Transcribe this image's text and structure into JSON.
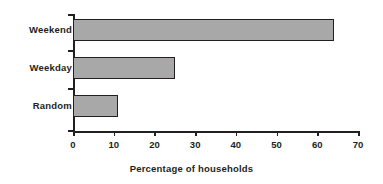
{
  "chart_data": {
    "type": "bar",
    "orientation": "horizontal",
    "title": "",
    "subtitle": "",
    "xlabel": "Percentage of households",
    "ylabel": "",
    "categories": [
      "Weekend",
      "Weekday",
      "Random"
    ],
    "values": [
      64,
      25,
      11
    ],
    "series": [
      {
        "name": "Percentage of households",
        "values": [
          64,
          25,
          11
        ]
      }
    ],
    "xlim": [
      0,
      70
    ],
    "xticks": [
      0,
      10,
      20,
      30,
      40,
      50,
      60,
      70
    ],
    "xtick_labels": [
      "0",
      "10",
      "20",
      "30",
      "40",
      "50",
      "60",
      "70"
    ],
    "grid": false,
    "legend": false,
    "legend_position": "none",
    "bar_fill_color": "#a8a8a8",
    "bar_border_color": "#231f20",
    "axis_color": "#231f20",
    "background_color": "#ffffff",
    "annotations": []
  }
}
